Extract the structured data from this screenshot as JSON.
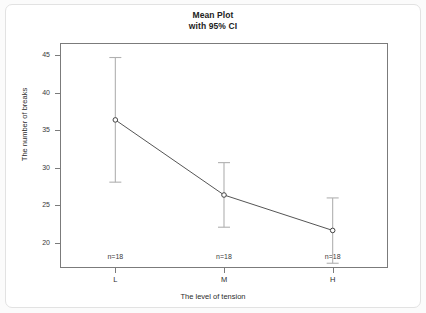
{
  "chart_data": {
    "type": "line",
    "title": "Mean Plot",
    "subtitle": "with 95% CI",
    "xlabel": "The level of tension",
    "ylabel": "The number of breaks",
    "categories": [
      "L",
      "M",
      "H"
    ],
    "values": [
      36.39,
      26.39,
      21.67
    ],
    "ci_lower": [
      28.1,
      22.1,
      17.3
    ],
    "ci_upper": [
      44.7,
      30.7,
      26.0
    ],
    "n_labels": [
      "n=18",
      "n=18",
      "n=18"
    ],
    "ytick_labels": [
      "20",
      "25",
      "30",
      "35",
      "40",
      "45"
    ],
    "ytick_values": [
      20,
      25,
      30,
      35,
      40,
      45
    ],
    "ylim": [
      16.8,
      46.5
    ],
    "grid": false,
    "legend": "none",
    "marker": "open-circle",
    "line_color": "#555555",
    "error_bar_color": "#b0b0b0"
  },
  "chart": {
    "title_line1": "Mean Plot",
    "title_line2": "with 95% CI"
  }
}
